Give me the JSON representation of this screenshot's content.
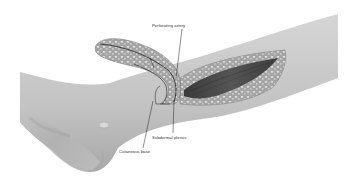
{
  "figure": {
    "colors": {
      "skin_light": "#cfcfcf",
      "skin_mid": "#b8b8b8",
      "skin_dark": "#9a9a9a",
      "flap_fat": "#a9a9a9",
      "fat_globule": "#e6e6e6",
      "muscle_bed": "#4a4a4a",
      "leader_line": "#222222",
      "label_text": "#333333",
      "background": "#ffffff"
    }
  },
  "labels": {
    "perforating_artery": "Perforating artery",
    "subdermal_plexus": "Subdermal plexus",
    "cutaneous_base": "Cutaneous base"
  }
}
